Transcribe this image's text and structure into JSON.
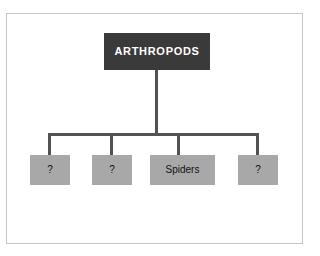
{
  "diagram": {
    "type": "hierarchy-tree",
    "background_color": "#ffffff",
    "frame_color": "#c6c6c6",
    "connector_color": "#525252",
    "root": {
      "label": "ARTHROPODS",
      "fill_color": "#3a3a3a",
      "text_color": "#ffffff"
    },
    "leaves": [
      {
        "label": "?",
        "fill_color": "#a8a8a8",
        "text_color": "#121212"
      },
      {
        "label": "?",
        "fill_color": "#a8a8a8",
        "text_color": "#121212"
      },
      {
        "label": "Spiders",
        "fill_color": "#a8a8a8",
        "text_color": "#121212"
      },
      {
        "label": "?",
        "fill_color": "#a8a8a8",
        "text_color": "#121212"
      }
    ]
  }
}
